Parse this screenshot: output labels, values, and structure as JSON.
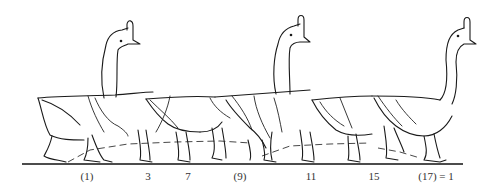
{
  "figure": {
    "background": "#ffffff",
    "line_color": "#1a1a1a"
  },
  "frame_labels": [
    {
      "text": "(1)",
      "x": 87
    },
    {
      "text": "3",
      "x": 148
    },
    {
      "text": "7",
      "x": 188
    },
    {
      "text": "(9)",
      "x": 240
    },
    {
      "text": "11",
      "x": 311
    },
    {
      "text": "15",
      "x": 374
    },
    {
      "text": "(17) = 1",
      "x": 436
    }
  ]
}
